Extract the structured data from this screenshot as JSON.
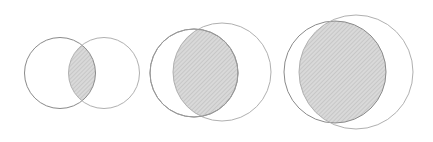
{
  "diagram": {
    "type": "venn-sequence",
    "colors": {
      "background": "#ffffff",
      "left_circle_stroke": "#8a8a8a",
      "right_circle_stroke": "#b0b0b0",
      "intersection_fill": "#d6d6d6",
      "hatch_line": "#bdbdbd"
    },
    "pairs": [
      {
        "id": "pair-1",
        "overlap": "small"
      },
      {
        "id": "pair-2",
        "overlap": "medium"
      },
      {
        "id": "pair-3",
        "overlap": "large"
      }
    ]
  }
}
